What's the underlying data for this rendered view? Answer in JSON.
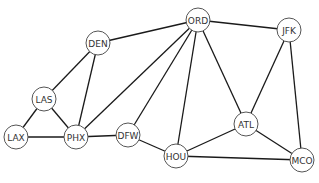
{
  "diagram": {
    "type": "network-graph",
    "node_radius": 12,
    "nodes": [
      {
        "id": "DEN",
        "label": "DEN",
        "x": 98,
        "y": 43
      },
      {
        "id": "ORD",
        "label": "ORD",
        "x": 198,
        "y": 20
      },
      {
        "id": "JFK",
        "label": "JFK",
        "x": 289,
        "y": 30
      },
      {
        "id": "LAS",
        "label": "LAS",
        "x": 44,
        "y": 99
      },
      {
        "id": "LAX",
        "label": "LAX",
        "x": 16,
        "y": 137
      },
      {
        "id": "PHX",
        "label": "PHX",
        "x": 76,
        "y": 137
      },
      {
        "id": "DFW",
        "label": "DFW",
        "x": 128,
        "y": 135
      },
      {
        "id": "HOU",
        "label": "HOU",
        "x": 176,
        "y": 156
      },
      {
        "id": "ATL",
        "label": "ATL",
        "x": 246,
        "y": 124
      },
      {
        "id": "MCO",
        "label": "MCO",
        "x": 302,
        "y": 160
      }
    ],
    "edges": [
      [
        "DEN",
        "ORD"
      ],
      [
        "DEN",
        "LAS"
      ],
      [
        "DEN",
        "PHX"
      ],
      [
        "ORD",
        "JFK"
      ],
      [
        "ORD",
        "PHX"
      ],
      [
        "ORD",
        "DFW"
      ],
      [
        "ORD",
        "HOU"
      ],
      [
        "ORD",
        "ATL"
      ],
      [
        "JFK",
        "ATL"
      ],
      [
        "JFK",
        "MCO"
      ],
      [
        "LAS",
        "LAX"
      ],
      [
        "LAS",
        "PHX"
      ],
      [
        "LAX",
        "PHX"
      ],
      [
        "PHX",
        "DFW"
      ],
      [
        "DFW",
        "HOU"
      ],
      [
        "HOU",
        "ATL"
      ],
      [
        "HOU",
        "MCO"
      ],
      [
        "ATL",
        "MCO"
      ]
    ]
  }
}
